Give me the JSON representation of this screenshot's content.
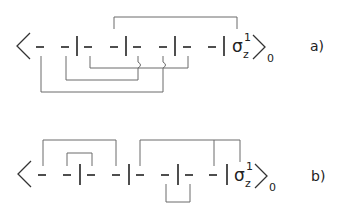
{
  "diagrams": [
    {
      "label": "a)",
      "operator": "σ",
      "operator_sub": "z",
      "operator_sup": "1",
      "bracket_sub": "0",
      "description": "Bracket expectation with four dash-pairs separated by bars; one upper contraction and three nested lower contractions with crossings"
    },
    {
      "label": "b)",
      "operator": "σ",
      "operator_sub": "z",
      "operator_sup": "1",
      "bracket_sub": "0",
      "description": "Bracket expectation with four dash-pairs; nested upper contractions, a three-leg upper contraction, and one lower contraction"
    }
  ]
}
